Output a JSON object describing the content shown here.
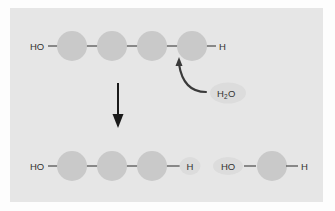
{
  "figure": {
    "name": "hydrolysis-diagram",
    "panel_background": "#e6e6e6",
    "page_background": "#fdfdfd",
    "monomer_color": "#c9c9c9",
    "bond_color": "#555555",
    "arrow_color": "#1a1a1a",
    "highlight_color": "#dcdcdc",
    "text_color": "#333333"
  },
  "top_row": {
    "name": "polymer-chain",
    "left_label": "HO",
    "right_label": "H",
    "monomer_count": 4,
    "monomers": [
      {
        "label": "",
        "cx": 72,
        "cy": 46
      },
      {
        "label": "",
        "cx": 112,
        "cy": 46
      },
      {
        "label": "",
        "cx": 152,
        "cy": 46
      },
      {
        "label": "",
        "cx": 192,
        "cy": 46
      }
    ]
  },
  "reactant": {
    "name": "water-molecule",
    "formula_main": "H",
    "formula_sub": "2",
    "formula_tail": "O",
    "full_text": "H2O"
  },
  "reaction_arrow": {
    "name": "reaction-direction-arrow",
    "direction": "down"
  },
  "curved_arrow": {
    "name": "attack-arrow",
    "description": "curved arrow from water to bond"
  },
  "bottom_row": {
    "name": "hydrolysis-products",
    "left_fragment": {
      "name": "product-left",
      "left_label": "HO",
      "right_label": "H",
      "right_label_highlighted": true,
      "monomer_count": 3,
      "monomers": [
        {
          "cx": 72,
          "cy": 166
        },
        {
          "cx": 112,
          "cy": 166
        },
        {
          "cx": 152,
          "cy": 166
        }
      ]
    },
    "right_fragment": {
      "name": "product-right",
      "left_label": "HO",
      "left_label_highlighted": true,
      "right_label": "H",
      "monomer_count": 1,
      "monomers": [
        {
          "cx": 272,
          "cy": 166
        }
      ]
    }
  }
}
